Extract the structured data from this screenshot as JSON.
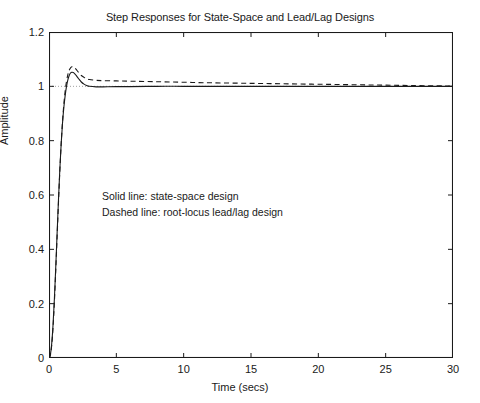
{
  "chart_data": {
    "type": "line",
    "title": "Step Responses for State-Space and Lead/Lag Designs",
    "xlabel": "Time (secs)",
    "ylabel": "Amplitude",
    "xlim": [
      0,
      30
    ],
    "ylim": [
      0,
      1.2
    ],
    "xticks": [
      0,
      5,
      10,
      15,
      20,
      25,
      30
    ],
    "xtick_labels": [
      "0",
      "5",
      "10",
      "15",
      "20",
      "25",
      "30"
    ],
    "yticks": [
      0,
      0.2,
      0.4,
      0.6,
      0.8,
      1,
      1.2
    ],
    "ytick_labels": [
      "0",
      "0.2",
      "0.4",
      "0.6",
      "0.8",
      "1",
      "1.2"
    ],
    "grid": false,
    "box": true,
    "tick_direction": "in",
    "legend_position": "none",
    "line_color": "#1a1a1a",
    "axis_color": "#1a1a1a",
    "background_color": "#ffffff",
    "reference_line_y": 1,
    "annotations": [
      {
        "text": "Solid line: state-space design",
        "x": 4.0,
        "y": 0.62
      },
      {
        "text": "Dashed line: root-locus lead/lag design",
        "x": 4.0,
        "y": 0.565
      }
    ],
    "series": [
      {
        "name": "state-space design",
        "style": "solid",
        "overshoot_peak": 1.052,
        "peak_time": 1.35,
        "settling_value": 1.0,
        "x": [
          0,
          0.1,
          0.2,
          0.3,
          0.4,
          0.5,
          0.6,
          0.7,
          0.8,
          0.9,
          1.0,
          1.1,
          1.2,
          1.3,
          1.4,
          1.5,
          1.6,
          1.7,
          1.8,
          1.9,
          2.0,
          2.2,
          2.4,
          2.6,
          2.8,
          3.0,
          3.5,
          4.0,
          5.0,
          6.0,
          8.0,
          10.0,
          12.0,
          15.0,
          18.0,
          21.0,
          24.0,
          27.0,
          30.0
        ],
        "y": [
          0,
          0.012,
          0.052,
          0.122,
          0.218,
          0.332,
          0.456,
          0.578,
          0.69,
          0.785,
          0.862,
          0.921,
          0.966,
          1.0,
          1.024,
          1.04,
          1.049,
          1.052,
          1.051,
          1.047,
          1.041,
          1.028,
          1.016,
          1.008,
          1.003,
          1.0,
          0.998,
          0.998,
          0.999,
          0.999,
          1.0,
          1.0,
          1.0,
          1.0,
          1.0,
          1.0,
          1.0,
          1.0,
          1.0
        ]
      },
      {
        "name": "root-locus lead/lag design",
        "style": "dashed",
        "overshoot_peak": 1.072,
        "peak_time": 1.7,
        "settling_value": 1.0,
        "x": [
          0,
          0.1,
          0.2,
          0.3,
          0.4,
          0.5,
          0.6,
          0.7,
          0.8,
          0.9,
          1.0,
          1.1,
          1.2,
          1.3,
          1.4,
          1.5,
          1.6,
          1.7,
          1.8,
          1.9,
          2.0,
          2.2,
          2.4,
          2.6,
          2.8,
          3.0,
          3.5,
          4.0,
          5.0,
          6.0,
          8.0,
          10.0,
          12.0,
          15.0,
          18.0,
          21.0,
          24.0,
          27.0,
          30.0
        ],
        "y": [
          0,
          0.01,
          0.046,
          0.112,
          0.206,
          0.32,
          0.444,
          0.568,
          0.683,
          0.784,
          0.867,
          0.933,
          0.983,
          1.018,
          1.043,
          1.059,
          1.068,
          1.072,
          1.071,
          1.068,
          1.063,
          1.051,
          1.04,
          1.033,
          1.028,
          1.025,
          1.022,
          1.021,
          1.02,
          1.019,
          1.017,
          1.015,
          1.013,
          1.011,
          1.009,
          1.007,
          1.005,
          1.003,
          1.001
        ]
      }
    ]
  }
}
